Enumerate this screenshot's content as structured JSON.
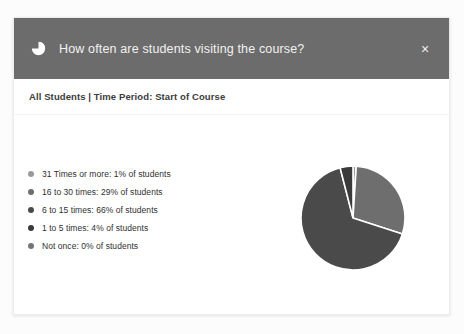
{
  "dialog": {
    "header": {
      "icon": "pie-chart-icon",
      "title": "How often are students visiting the course?",
      "close_label": "×",
      "background_color": "#6c6c6c"
    },
    "subtitle": "All Students | Time Period: Start of Course"
  },
  "chart_data": {
    "type": "pie",
    "title": "How often are students visiting the course?",
    "subtitle": "All Students | Time Period: Start of Course",
    "unit": "% of students",
    "legend_position": "left",
    "grid": false,
    "categories": [
      "31 Times or more",
      "16 to 30 times",
      "6 to 15 times",
      "1 to 5 times",
      "Not once"
    ],
    "values": [
      1,
      29,
      66,
      4,
      0
    ],
    "colors": [
      "#9a9a9a",
      "#6e6e6e",
      "#4a4a4a",
      "#3a3a3a",
      "#757575"
    ],
    "slice_border_color": "#ffffff",
    "legend": [
      {
        "label": "31 Times or more: 1% of students",
        "name": "31 Times or more",
        "value": 1,
        "color": "#9a9a9a"
      },
      {
        "label": "16 to 30 times: 29% of students",
        "name": "16 to 30 times",
        "value": 29,
        "color": "#6e6e6e"
      },
      {
        "label": "6 to 15 times: 66% of students",
        "name": "6 to 15 times",
        "value": 66,
        "color": "#4a4a4a"
      },
      {
        "label": "1 to 5 times: 4% of students",
        "name": "1 to 5 times",
        "value": 4,
        "color": "#3a3a3a"
      },
      {
        "label": "Not once: 0% of students",
        "name": "Not once",
        "value": 0,
        "color": "#757575"
      }
    ]
  }
}
